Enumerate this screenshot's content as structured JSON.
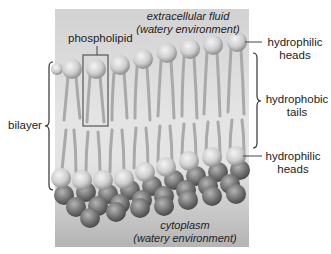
{
  "diagram": {
    "regions": {
      "top": {
        "line1": "extracellular fluid",
        "line2": "(watery environment)"
      },
      "bottom": {
        "line1": "cytoplasm",
        "line2": "(watery environment)"
      }
    },
    "labels": {
      "phospholipid": "phospholipid",
      "bilayer": "bilayer",
      "heads_top": {
        "line1": "hydrophilic",
        "line2": "heads"
      },
      "tails": {
        "line1": "hydrophobic",
        "line2": "tails"
      },
      "heads_bottom": {
        "line1": "hydrophilic",
        "line2": "heads"
      }
    },
    "colors": {
      "panel": "#cfcfcf",
      "panel_dark": "#a9a9a9",
      "head_light": "#d9d9d9",
      "head_dark": "#7d7d7d",
      "tail": "#a8a8a8",
      "line": "#444444",
      "box": "#555555"
    }
  }
}
